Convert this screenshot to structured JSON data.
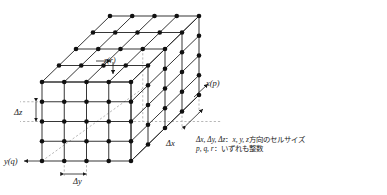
{
  "figure": {
    "grid": {
      "cells_x": 4,
      "cells_y": 4,
      "cells_z": 4,
      "nodes_per_edge": 5,
      "projection": "oblique",
      "front_bottom_left": [
        42,
        161
      ],
      "front_top_left": [
        42,
        82
      ],
      "front_bottom_right": [
        131,
        161
      ],
      "depth_offset": [
        68,
        -66
      ],
      "node_color": "#111111",
      "line_color": "#2b2b2b",
      "dash_color": "#9a9a9a",
      "node_radius": 2.3
    },
    "axis_labels": [
      {
        "id": "z-axis-label",
        "text": "z(r)",
        "x": 104,
        "y": 57
      },
      {
        "id": "x-axis-label",
        "text": "x(p)",
        "x": 206,
        "y": 79
      },
      {
        "id": "y-axis-label",
        "text": "y(q)",
        "x": 4,
        "y": 157
      }
    ],
    "dimension_labels": [
      {
        "id": "delta-z-label",
        "text": "Δz",
        "x": 14,
        "y": 108
      },
      {
        "id": "delta-y-label",
        "text": "Δy",
        "x": 73,
        "y": 177
      },
      {
        "id": "delta-x-label",
        "text": "Δx",
        "x": 166,
        "y": 139
      }
    ],
    "legend": {
      "line1": "Δx, Δy, Δz：x, y, z 方向のセルサイズ",
      "line1_symbols": "Δx, Δy, Δz",
      "line1_axes": "x, y, z",
      "line1_tail": "方向のセルサイズ",
      "line2": "p, q, r：いずれも整数",
      "line2_symbols": "p, q, r",
      "line2_tail": "いずれも整数",
      "colon": "：",
      "x": 196,
      "y": 136
    }
  }
}
